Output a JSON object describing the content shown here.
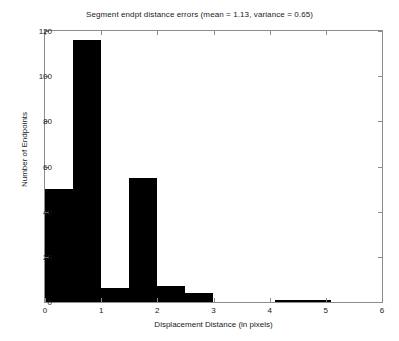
{
  "chart_data": {
    "type": "bar",
    "title": "Segment endpt distance errors (mean = 1.13, variance = 0.65)",
    "xlabel": "Displacement Distance (in pixels)",
    "ylabel": "Number of Endpoints",
    "xlim": [
      0,
      6
    ],
    "ylim": [
      0,
      120
    ],
    "xticks": [
      0,
      1,
      2,
      3,
      4,
      5,
      6
    ],
    "xtick_labels": [
      "0",
      "1",
      "2",
      "3",
      "4",
      "5",
      "6"
    ],
    "yticks": [
      0,
      20,
      40,
      60,
      80,
      100,
      120
    ],
    "ytick_labels": [
      "0",
      "20",
      "40",
      "60",
      "80",
      "100",
      "120"
    ],
    "grid": false,
    "legend": null,
    "bar_color": "#000000",
    "axis_color": "#8c8c8c",
    "bin_width": 0.5,
    "bins": [
      {
        "x0": 0.0,
        "x1": 0.5,
        "value": 50
      },
      {
        "x0": 0.5,
        "x1": 1.0,
        "value": 116
      },
      {
        "x0": 1.0,
        "x1": 1.5,
        "value": 6
      },
      {
        "x0": 1.5,
        "x1": 2.0,
        "value": 55
      },
      {
        "x0": 2.0,
        "x1": 2.5,
        "value": 7
      },
      {
        "x0": 2.5,
        "x1": 3.0,
        "value": 4
      },
      {
        "x0": 4.1,
        "x1": 5.1,
        "value": 1
      }
    ],
    "categories": [
      "0-0.5",
      "0.5-1",
      "1-1.5",
      "1.5-2",
      "2-2.5",
      "2.5-3",
      "4.1-5.1"
    ],
    "values": [
      50,
      116,
      6,
      55,
      7,
      4,
      1
    ],
    "annotations": {
      "mean": "1.13",
      "variance": "0.65"
    }
  }
}
